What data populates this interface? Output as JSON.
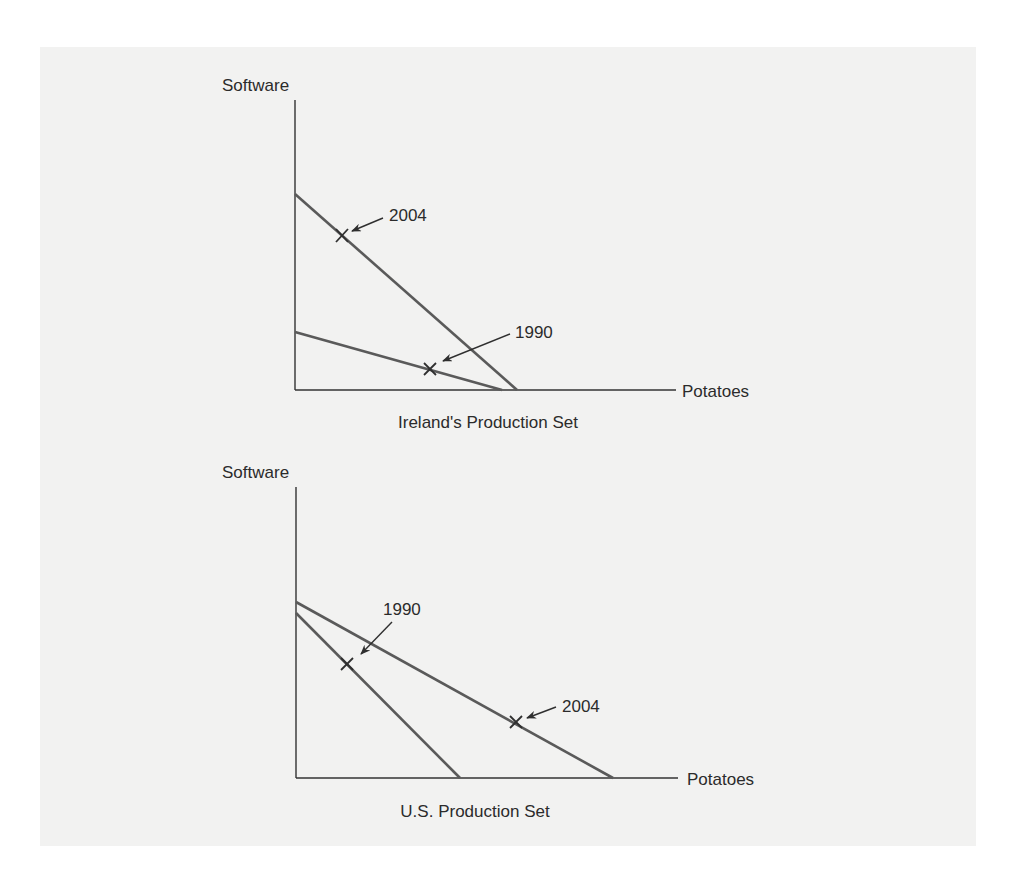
{
  "figure": {
    "background_color": "#f2f2f1",
    "line_color": "#5a5a5a",
    "axis_color": "#333333"
  },
  "charts": [
    {
      "id": "ireland",
      "caption": "Ireland's Production Set",
      "y_axis_label": "Software",
      "x_axis_label": "Potatoes",
      "frontiers": [
        {
          "year": "1990",
          "software_intercept": 332,
          "potatoes_intercept": 502
        },
        {
          "year": "2004",
          "software_intercept": 194,
          "potatoes_intercept": 517
        }
      ],
      "markers": [
        {
          "label": "2004",
          "on_frontier": "2004"
        },
        {
          "label": "1990",
          "on_frontier": "1990"
        }
      ]
    },
    {
      "id": "us",
      "caption": "U.S. Production Set",
      "y_axis_label": "Software",
      "x_axis_label": "Potatoes",
      "frontiers": [
        {
          "year": "1990",
          "software_intercept": 613,
          "potatoes_intercept": 460
        },
        {
          "year": "2004",
          "software_intercept": 602,
          "potatoes_intercept": 613
        }
      ],
      "markers": [
        {
          "label": "1990",
          "on_frontier": "1990"
        },
        {
          "label": "2004",
          "on_frontier": "2004"
        }
      ]
    }
  ]
}
